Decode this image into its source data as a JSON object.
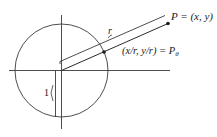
{
  "diagram": {
    "labels": {
      "P": "P = (x, y)",
      "P_theta_coords": "(x/r, y/r) = P",
      "P_theta_sub": "θ",
      "r": "r",
      "one": "1"
    },
    "elements": {
      "x_axis": "horizontal axis",
      "y_axis": "vertical axis",
      "unit_circle": "circle of radius 1 centered at origin",
      "ray_to_P": "segment from origin to P",
      "r_brace_line": "parallel offset line indicating length r",
      "radius_marker": "vertical radius of length 1"
    },
    "colors": {
      "stroke": "#2a2a2a",
      "background": "#ffffff"
    }
  }
}
